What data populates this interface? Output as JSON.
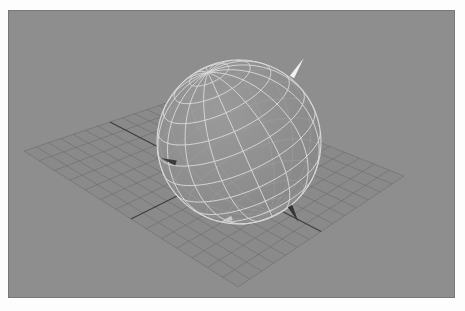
{
  "viewport": {
    "width": 465,
    "height": 311,
    "page_background": "#fdfdfd"
  },
  "canvas": {
    "name": "3d-viewport",
    "x": 8,
    "y": 10,
    "width": 447,
    "height": 288,
    "background_color": "#8e8e8e",
    "border_color": "#787878"
  },
  "scene": {
    "title": "",
    "type": "3d-wireframe-sphere-on-grid-plane",
    "ground_plane": {
      "name": "ground-grid-plane",
      "fill_color": "#8a8a8a",
      "grid_line_color": "#6a6a6a",
      "axis_line_color": "#3a3a3a",
      "divisions_u": 14,
      "divisions_v": 14,
      "corners": {
        "left": {
          "x": 24,
          "y": 151
        },
        "top": {
          "x": 196,
          "y": 93
        },
        "right": {
          "x": 404,
          "y": 176
        },
        "bottom": {
          "x": 238,
          "y": 287
        }
      },
      "axis_u_index": 7,
      "axis_v_index": 7
    },
    "sphere": {
      "name": "wireframe-sphere",
      "center": {
        "x": 239,
        "y": 142
      },
      "radius": 82,
      "wire_color": "#d8d8d8",
      "wire_color_back": "#a3a3a3",
      "fill_color": "#8c8c8c",
      "meridians": 16,
      "parallels": 12,
      "pole_tilt_deg": 24,
      "pole_screen": {
        "x": 292,
        "y": 77
      }
    },
    "markers": [
      {
        "name": "north-pole-arrow",
        "label": "axis arrow (north pole)",
        "color": "#f2f2f2",
        "x": 292,
        "y": 77,
        "angle_deg": -58,
        "length": 22,
        "width": 5
      },
      {
        "name": "left-surface-arrow",
        "label": "surface normal arrow (left)",
        "color": "#3b3b3b",
        "x": 176,
        "y": 163,
        "angle_deg": 198,
        "length": 16,
        "width": 5
      },
      {
        "name": "bottom-right-arrow",
        "label": "surface normal arrow (lower right)",
        "color": "#343434",
        "x": 290,
        "y": 206,
        "angle_deg": 62,
        "length": 18,
        "width": 5
      },
      {
        "name": "bottom-light-marker",
        "label": "highlight marker (bottom)",
        "color": "#c9c9c9",
        "x": 232,
        "y": 218,
        "angle_deg": 160,
        "length": 13,
        "width": 5
      }
    ]
  }
}
